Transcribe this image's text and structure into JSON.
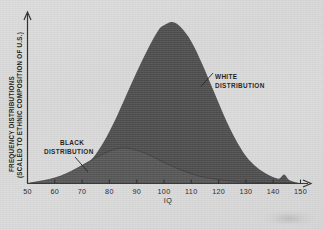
{
  "chart_data": {
    "type": "area",
    "title": "",
    "subtitle": "",
    "xlabel": "IQ",
    "ylabel_line1": "FREQUENCY DISTRIBUTIONS",
    "ylabel_line2": "(SCALED TO ETHNIC COMPOSITION OF U.S.)",
    "xlim": [
      50,
      150
    ],
    "ylim": [
      0,
      1
    ],
    "xticks": [
      50,
      60,
      70,
      80,
      90,
      100,
      110,
      120,
      130,
      140,
      150
    ],
    "xticklabels": [
      "50",
      "60",
      "70",
      "80",
      "90",
      "100",
      "110",
      "120",
      "130",
      "140",
      "150"
    ],
    "yticks": [],
    "yticklabels": [],
    "grid": false,
    "legend": "annotations",
    "fill_color": "#4d4d4d",
    "background_color": "#d9d9d9",
    "axis_color": "#2b2b2b",
    "annotations": [
      {
        "name": "white-distribution",
        "label_line1": "WHITE",
        "label_line2": "DISTRIBUTION",
        "peak_x": 103,
        "peak_y": 1.0,
        "mean": 103,
        "sd": 15
      },
      {
        "name": "black-distribution",
        "label_line1": "BLACK",
        "label_line2": "DISTRIBUTION",
        "peak_x": 85,
        "peak_y": 0.22,
        "mean": 85,
        "sd": 13
      }
    ],
    "series": [
      {
        "name": "WHITE DISTRIBUTION",
        "x": [
          50,
          54,
          58,
          62,
          66,
          70,
          74,
          78,
          82,
          86,
          90,
          94,
          98,
          100,
          103,
          106,
          110,
          114,
          118,
          122,
          126,
          130,
          134,
          138,
          142,
          144,
          146,
          150
        ],
        "values": [
          0.0,
          0.01,
          0.02,
          0.035,
          0.06,
          0.1,
          0.16,
          0.26,
          0.39,
          0.54,
          0.69,
          0.83,
          0.95,
          0.98,
          1.0,
          0.97,
          0.88,
          0.74,
          0.58,
          0.42,
          0.28,
          0.17,
          0.1,
          0.055,
          0.03,
          0.055,
          0.02,
          0.0
        ]
      },
      {
        "name": "BLACK DISTRIBUTION",
        "x": [
          50,
          54,
          58,
          62,
          66,
          70,
          74,
          78,
          82,
          85,
          88,
          92,
          96,
          100,
          104,
          108,
          112,
          116,
          120,
          124,
          128,
          132,
          136,
          140,
          145,
          150
        ],
        "values": [
          0.0,
          0.012,
          0.025,
          0.045,
          0.075,
          0.112,
          0.15,
          0.185,
          0.212,
          0.22,
          0.215,
          0.195,
          0.165,
          0.13,
          0.1,
          0.072,
          0.05,
          0.035,
          0.024,
          0.016,
          0.011,
          0.008,
          0.006,
          0.004,
          0.003,
          0.0
        ]
      }
    ]
  }
}
